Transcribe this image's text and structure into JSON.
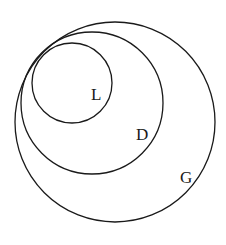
{
  "diagram": {
    "type": "nested-tangent-circles",
    "stroke_color": "#1a1a1a",
    "background": "#ffffff",
    "circles": [
      {
        "id": "G",
        "label": "G",
        "cx": 115,
        "cy": 122,
        "r": 100,
        "label_x": 180,
        "label_y": 183
      },
      {
        "id": "D",
        "label": "D",
        "cx": 92,
        "cy": 103,
        "r": 71,
        "label_x": 136,
        "label_y": 140
      },
      {
        "id": "L",
        "label": "L",
        "cx": 72,
        "cy": 83,
        "r": 40,
        "label_x": 91,
        "label_y": 100
      }
    ],
    "labels": {
      "outer": "G",
      "middle": "D",
      "inner": "L"
    }
  }
}
